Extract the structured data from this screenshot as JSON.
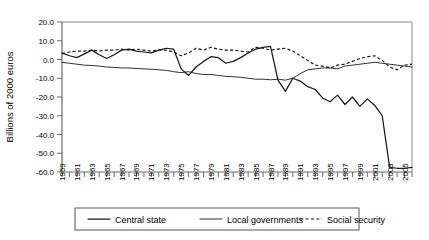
{
  "chart_data": {
    "type": "line",
    "title": "",
    "xlabel": "",
    "ylabel": "Billions of 2000 euros",
    "ylim": [
      -60,
      20
    ],
    "ytick_values": [
      20,
      10,
      0,
      -10,
      -20,
      -30,
      -40,
      -50,
      -60
    ],
    "ytick_labels": [
      "20.0",
      "10.0",
      "0.0",
      "-10.0",
      "-20.0",
      "-30.0",
      "-40.0",
      "-50.0",
      "-60.0"
    ],
    "xlim": [
      1959,
      2006
    ],
    "x": [
      1959,
      1960,
      1961,
      1962,
      1963,
      1964,
      1965,
      1966,
      1967,
      1968,
      1969,
      1970,
      1971,
      1972,
      1973,
      1974,
      1975,
      1976,
      1977,
      1978,
      1979,
      1980,
      1981,
      1982,
      1983,
      1984,
      1985,
      1986,
      1987,
      1988,
      1989,
      1990,
      1991,
      1992,
      1993,
      1994,
      1995,
      1996,
      1997,
      1998,
      1999,
      2000,
      2001,
      2002,
      2003,
      2004,
      2005,
      2006
    ],
    "xtick_labels": [
      "1959",
      "1961",
      "1963",
      "1965",
      "1967",
      "1969",
      "1971",
      "1973",
      "1975",
      "1977",
      "1979",
      "1981",
      "1983",
      "1985",
      "1987",
      "1989",
      "1991",
      "1993",
      "1995",
      "1997",
      "1999",
      "2001",
      "2003",
      "2005"
    ],
    "grid": false,
    "legend_position": "below",
    "series": [
      {
        "name": "Central state",
        "style": "solid-thick",
        "color": "#1a1a1a",
        "values": [
          3.5,
          2.0,
          1.0,
          3.0,
          5.0,
          2.5,
          0.5,
          2.5,
          5.0,
          5.5,
          4.5,
          4.0,
          3.5,
          5.0,
          6.0,
          5.5,
          -5.0,
          -8.5,
          -4.0,
          -1.0,
          1.5,
          1.0,
          -2.0,
          -1.0,
          1.0,
          3.5,
          5.5,
          6.5,
          7.0,
          -11.0,
          -17.0,
          -10.0,
          -11.5,
          -14.5,
          -16.0,
          -20.5,
          -22.5,
          -19.0,
          -24.0,
          -20.0,
          -25.0,
          -21.0,
          -24.5,
          -30.0,
          -57.5,
          -58.0,
          -58.0,
          -57.5
        ]
      },
      {
        "name": "Local governments",
        "style": "solid-thin",
        "color": "#1a1a1a",
        "values": [
          -1.5,
          -2.0,
          -2.5,
          -3.0,
          -3.2,
          -3.5,
          -4.0,
          -4.2,
          -4.5,
          -4.5,
          -4.8,
          -5.0,
          -5.2,
          -5.5,
          -5.8,
          -6.5,
          -7.0,
          -6.5,
          -7.5,
          -8.0,
          -8.0,
          -8.5,
          -9.0,
          -9.2,
          -9.5,
          -10.0,
          -10.5,
          -10.5,
          -10.8,
          -10.5,
          -11.0,
          -10.0,
          -7.5,
          -5.5,
          -5.0,
          -4.5,
          -4.5,
          -5.0,
          -3.5,
          -3.0,
          -2.5,
          -2.0,
          -1.5,
          -2.0,
          -2.5,
          -3.0,
          -3.5,
          -4.0
        ]
      },
      {
        "name": "Social security",
        "style": "dashed",
        "color": "#1a1a1a",
        "values": [
          3.0,
          4.0,
          4.5,
          4.5,
          5.0,
          4.5,
          5.0,
          5.0,
          5.5,
          5.0,
          5.5,
          5.0,
          4.5,
          5.0,
          5.0,
          4.0,
          2.0,
          3.5,
          6.0,
          5.0,
          6.5,
          5.5,
          5.0,
          5.0,
          4.5,
          4.0,
          6.5,
          6.0,
          5.0,
          5.5,
          6.0,
          4.5,
          2.0,
          -0.5,
          -3.0,
          -3.5,
          -4.5,
          -3.0,
          -2.5,
          -1.0,
          0.5,
          1.5,
          2.0,
          -0.5,
          -4.0,
          -5.5,
          -3.0,
          -2.5
        ]
      }
    ]
  },
  "legend": {
    "items": [
      {
        "label": "Central state",
        "style": "solid-thick"
      },
      {
        "label": "Local governments",
        "style": "solid-thin"
      },
      {
        "label": "Social security",
        "style": "dashed"
      }
    ]
  }
}
